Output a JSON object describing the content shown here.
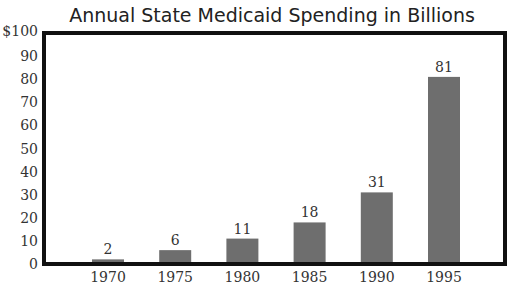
{
  "chart_data": {
    "type": "bar",
    "title": "Annual State Medicaid Spending in Billions",
    "xlabel": "",
    "ylabel": "",
    "categories": [
      "1970",
      "1975",
      "1980",
      "1985",
      "1990",
      "1995"
    ],
    "values": [
      2,
      6,
      11,
      18,
      31,
      81
    ],
    "data_labels": [
      "2",
      "6",
      "11",
      "18",
      "31",
      "81"
    ],
    "ylim": [
      0,
      100
    ],
    "yticks": [
      0,
      10,
      20,
      30,
      40,
      50,
      60,
      70,
      80,
      90,
      100
    ],
    "ytick_labels": [
      "0",
      "10",
      "20",
      "30",
      "40",
      "50",
      "60",
      "70",
      "80",
      "90",
      "$100"
    ],
    "grid": false,
    "legend": null,
    "colors": {
      "bar": "#6e6e6e",
      "frame": "#111111",
      "text": "#333333"
    }
  }
}
